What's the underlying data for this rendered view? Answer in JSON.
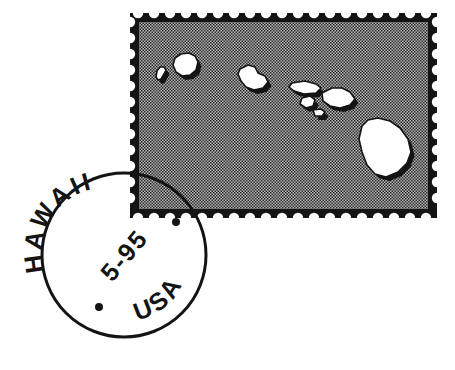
{
  "scene": {
    "title": "Hawaii postage stamp with circular postmark cancellation",
    "background_color": "#ffffff",
    "ink_color": "#141414"
  },
  "stamp": {
    "name": "hawaii-islands-stamp",
    "frame": {
      "x": 130,
      "y": 13,
      "width": 307,
      "height": 205
    },
    "border_color": "#141414",
    "border_width": 9,
    "interior_fill_color": "#a9a9a9",
    "halftone": {
      "pattern": "checker-dither",
      "dot_size": 2,
      "dot_color": "#1a1a1a"
    },
    "perforation": {
      "style": "square-notch",
      "notch_size": 8,
      "count_top": 19,
      "count_side": 12
    },
    "islands": [
      {
        "name": "niihau",
        "label": "Niihau",
        "fill": "#ffffff",
        "outline": "#141414",
        "shadow": "#141414",
        "path": "M157,71 L160,67 L164,67 L166,70 L164,74 L161,79 L158,80 L156,77 Z"
      },
      {
        "name": "kauai",
        "label": "Kauai",
        "fill": "#ffffff",
        "outline": "#141414",
        "shadow": "#141414",
        "path": "M175,58 L181,54 L189,53 L195,56 L198,62 L196,70 L190,75 L182,76 L176,72 L173,65 Z"
      },
      {
        "name": "oahu",
        "label": "Oahu",
        "fill": "#ffffff",
        "outline": "#141414",
        "shadow": "#141414",
        "path": "M240,69 L248,65 L255,67 L258,73 L265,76 L268,82 L263,88 L254,90 L246,87 L241,81 L238,74 Z"
      },
      {
        "name": "molokai",
        "label": "Molokai",
        "fill": "#ffffff",
        "outline": "#141414",
        "shadow": "#141414",
        "path": "M292,83 L305,81 L316,84 L321,88 L316,93 L304,94 L294,91 L289,87 Z"
      },
      {
        "name": "lanai",
        "label": "Lanai",
        "fill": "#ffffff",
        "outline": "#141414",
        "shadow": "#141414",
        "path": "M302,98 L310,96 L315,100 L313,106 L306,108 L300,104 Z"
      },
      {
        "name": "kahoolawe",
        "label": "Kahoolawe",
        "fill": "#ffffff",
        "outline": "#141414",
        "shadow": "#141414",
        "path": "M313,110 L321,109 L325,112 L322,116 L315,116 Z"
      },
      {
        "name": "maui",
        "label": "Maui",
        "fill": "#ffffff",
        "outline": "#141414",
        "shadow": "#141414",
        "path": "M322,93 L332,88 L342,88 L350,92 L355,99 L350,105 L340,108 L330,106 L323,101 Z"
      },
      {
        "name": "hawaii-big-island",
        "label": "Hawaii",
        "fill": "#ffffff",
        "outline": "#141414",
        "shadow": "#141414",
        "path": "M362,126 L368,120 L378,118 L390,121 L400,128 L408,139 L411,152 L407,163 L398,172 L386,177 L375,174 L367,165 L362,152 L359,139 Z"
      }
    ]
  },
  "postmark": {
    "name": "postmark-cancellation",
    "shape": "circle",
    "center": {
      "x": 124,
      "y": 255
    },
    "radius": 82,
    "stroke_color": "#141414",
    "stroke_width": 3,
    "fill": "none",
    "location_text": "HAWAII",
    "date_text": "5-95",
    "country_text": "USA",
    "date_rotation_deg": -50,
    "dots": [
      {
        "name": "dot-bottom-left",
        "x": 99,
        "y": 307,
        "r": 4
      },
      {
        "name": "dot-top-right",
        "x": 176,
        "y": 222,
        "r": 4
      }
    ]
  }
}
